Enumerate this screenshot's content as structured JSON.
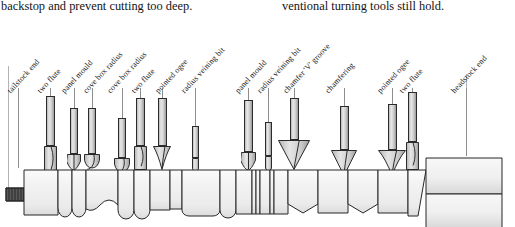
{
  "page": {
    "width": 515,
    "height": 227,
    "background": "#ffffff",
    "ink": "#111111"
  },
  "body_text": {
    "left_column": "backstop and prevent cutting too deep.",
    "right_column": "ventional turning tools still hold."
  },
  "figure": {
    "orientation_note": "tailstock at left, headstock at right",
    "label_rotation_deg": -47,
    "callouts": [
      {
        "id": "c01",
        "label": "tailstock end",
        "x": 12,
        "y": 68,
        "leader_x": 18,
        "leader_top": 70,
        "leader_bottom": 150
      },
      {
        "id": "c02",
        "label": "two flute",
        "x": 42,
        "y": 68,
        "leader_x": 50,
        "leader_top": 70,
        "leader_bottom": 88
      },
      {
        "id": "c03",
        "label": "panel mould",
        "x": 66,
        "y": 68,
        "leader_x": 74,
        "leader_top": 70,
        "leader_bottom": 92
      },
      {
        "id": "c04",
        "label": "cove box radius",
        "x": 88,
        "y": 68,
        "leader_x": 92,
        "leader_top": 70,
        "leader_bottom": 92
      },
      {
        "id": "c05",
        "label": "cove box radius",
        "x": 112,
        "y": 68,
        "leader_x": 122,
        "leader_top": 70,
        "leader_bottom": 100
      },
      {
        "id": "c06",
        "label": "two flute",
        "x": 136,
        "y": 68,
        "leader_x": 140,
        "leader_top": 70,
        "leader_bottom": 88
      },
      {
        "id": "c07",
        "label": "pointed ogee",
        "x": 160,
        "y": 68,
        "leader_x": 162,
        "leader_top": 70,
        "leader_bottom": 88
      },
      {
        "id": "c08",
        "label": "radius veining bit",
        "x": 186,
        "y": 68,
        "leader_x": 195,
        "leader_top": 70,
        "leader_bottom": 108
      },
      {
        "id": "c09",
        "label": "panel mould",
        "x": 240,
        "y": 68,
        "leader_x": 248,
        "leader_top": 70,
        "leader_bottom": 88
      },
      {
        "id": "c10",
        "label": "radius veining bit",
        "x": 262,
        "y": 68,
        "leader_x": 268,
        "leader_top": 70,
        "leader_bottom": 104
      },
      {
        "id": "c11",
        "label": "chamfer 'V' groove",
        "x": 288,
        "y": 68,
        "leader_x": 294,
        "leader_top": 70,
        "leader_bottom": 88
      },
      {
        "id": "c12",
        "label": "chamfering",
        "x": 330,
        "y": 68,
        "leader_x": 344,
        "leader_top": 70,
        "leader_bottom": 92
      },
      {
        "id": "c13",
        "label": "pointed ogee",
        "x": 382,
        "y": 68,
        "leader_x": 392,
        "leader_top": 70,
        "leader_bottom": 90
      },
      {
        "id": "c14",
        "label": "two flute",
        "x": 404,
        "y": 68,
        "leader_x": 412,
        "leader_top": 70,
        "leader_bottom": 82
      },
      {
        "id": "c15",
        "label": "headstock end",
        "x": 456,
        "y": 68,
        "leader_x": 466,
        "leader_top": 70,
        "leader_bottom": 138
      }
    ],
    "bits": [
      {
        "id": "b01",
        "type": "two-flute",
        "cx": 50,
        "shank_top": 78,
        "shank_h": 50,
        "shank_w": 9,
        "cut_top": 128,
        "cut_h": 28,
        "cut_w": 13
      },
      {
        "id": "b02",
        "type": "panel-mould",
        "cx": 74,
        "shank_top": 90,
        "shank_h": 46,
        "shank_w": 8,
        "cut_top": 136,
        "cut_h": 16,
        "cut_w": 14
      },
      {
        "id": "b03",
        "type": "cove-box-radius",
        "cx": 92,
        "shank_top": 90,
        "shank_h": 46,
        "shank_w": 8,
        "cut_top": 136,
        "cut_h": 18,
        "cut_w": 16
      },
      {
        "id": "b04",
        "type": "cove-box-radius",
        "cx": 122,
        "shank_top": 100,
        "shank_h": 40,
        "shank_w": 8,
        "cut_top": 140,
        "cut_h": 18,
        "cut_w": 16
      },
      {
        "id": "b05",
        "type": "two-flute",
        "cx": 140,
        "shank_top": 80,
        "shank_h": 48,
        "shank_w": 9,
        "cut_top": 128,
        "cut_h": 24,
        "cut_w": 13
      },
      {
        "id": "b06",
        "type": "pointed-ogee",
        "cx": 162,
        "shank_top": 80,
        "shank_h": 48,
        "shank_w": 9,
        "cut_top": 128,
        "cut_h": 24,
        "cut_w": 18
      },
      {
        "id": "b07",
        "type": "radius-veining",
        "cx": 195,
        "shank_top": 108,
        "shank_h": 32,
        "shank_w": 7,
        "cut_top": 140,
        "cut_h": 18,
        "cut_w": 7
      },
      {
        "id": "b08",
        "type": "panel-mould",
        "cx": 248,
        "shank_top": 82,
        "shank_h": 52,
        "shank_w": 9,
        "cut_top": 134,
        "cut_h": 18,
        "cut_w": 15
      },
      {
        "id": "b09",
        "type": "radius-veining",
        "cx": 268,
        "shank_top": 104,
        "shank_h": 34,
        "shank_w": 7,
        "cut_top": 138,
        "cut_h": 20,
        "cut_w": 7
      },
      {
        "id": "b10",
        "type": "chamfer-v-groove",
        "cx": 294,
        "shank_top": 80,
        "shank_h": 42,
        "shank_w": 9,
        "cut_top": 122,
        "cut_h": 30,
        "cut_w": 32
      },
      {
        "id": "b11",
        "type": "chamfering",
        "cx": 344,
        "shank_top": 88,
        "shank_h": 44,
        "shank_w": 9,
        "cut_top": 132,
        "cut_h": 26,
        "cut_w": 26
      },
      {
        "id": "b12",
        "type": "pointed-ogee",
        "cx": 392,
        "shank_top": 86,
        "shank_h": 46,
        "shank_w": 9,
        "cut_top": 132,
        "cut_h": 26,
        "cut_w": 28
      },
      {
        "id": "b13",
        "type": "two-flute",
        "cx": 412,
        "shank_top": 74,
        "shank_h": 50,
        "shank_w": 9,
        "cut_top": 124,
        "cut_h": 28,
        "cut_w": 13
      }
    ],
    "spindle": {
      "stroke": "#262626",
      "fill_light": "#f4f4f4",
      "fill_shade": "#e4e4e4",
      "axis_top": 152,
      "axis_bottom": 205,
      "segments_note": "square pommel, beads, coves, vee-cuts, headstock block"
    }
  }
}
